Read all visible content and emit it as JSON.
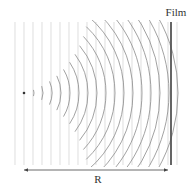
{
  "diagram": {
    "labels": {
      "film": "Film",
      "distance": "R"
    },
    "source": {
      "x": 24,
      "y": 93,
      "radius": 1.3,
      "color": "#333333"
    },
    "plane_waves": {
      "x_positions": [
        15,
        24,
        33,
        42,
        51,
        60,
        69,
        78,
        87,
        96,
        105,
        114,
        123,
        132,
        141,
        150,
        159,
        168,
        177
      ],
      "y_top": 22,
      "y_bottom": 165,
      "color": "#d0d0d0",
      "stroke_width": 0.7
    },
    "spherical_waves": {
      "center_x": 24,
      "center_y": 93,
      "first_radius": 10,
      "radius_step": 9,
      "count": 17,
      "first_half_angle_deg": 18,
      "half_angle_step_deg": 3.2,
      "max_half_angle_deg": 60,
      "y_clip_top": 20,
      "y_clip_bottom": 167,
      "color": "#8a8a8a",
      "stroke_width": 0.8
    },
    "film": {
      "x": 171,
      "y_top": 22,
      "y_bottom": 165,
      "color": "#555555",
      "stroke_width": 1.8
    },
    "distance_arrow": {
      "x_start": 20,
      "x_end": 172,
      "y": 170,
      "color": "#444444"
    },
    "label_positions": {
      "film": {
        "x": 176,
        "y": 16
      },
      "distance": {
        "x": 98,
        "y": 183
      }
    }
  }
}
